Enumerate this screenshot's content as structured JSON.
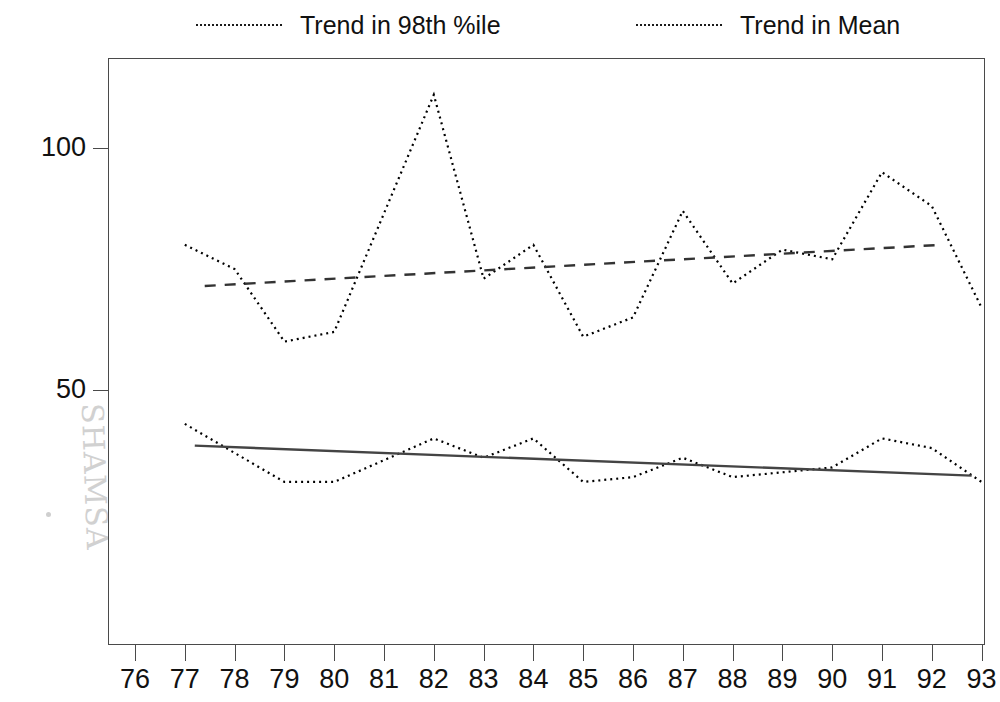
{
  "chart_data": {
    "type": "line",
    "title": "",
    "subtitle": "",
    "xlabel": "",
    "ylabel": "",
    "x": [
      76,
      77,
      78,
      79,
      80,
      81,
      82,
      83,
      84,
      85,
      86,
      87,
      88,
      89,
      90,
      91,
      92,
      93
    ],
    "categories": [
      "76",
      "77",
      "78",
      "79",
      "80",
      "81",
      "82",
      "83",
      "84",
      "85",
      "86",
      "87",
      "88",
      "89",
      "90",
      "91",
      "92",
      "93"
    ],
    "xlim": [
      75.5,
      93.5
    ],
    "ylim": [
      10,
      122
    ],
    "yticks": [
      50,
      100
    ],
    "ytick_labels": [
      "50",
      "100"
    ],
    "grid": false,
    "legend_position": "top",
    "series": [
      {
        "name": "Trend in 98th %ile",
        "marker": "plus",
        "linestyle": "dotted",
        "color": "#000000",
        "x": [
          77,
          78,
          79,
          80,
          82,
          83,
          84,
          85,
          86,
          87,
          88,
          89,
          90,
          91,
          92,
          93
        ],
        "values": [
          80,
          75,
          60,
          62,
          111,
          73,
          80,
          61,
          65,
          87,
          72,
          79,
          77,
          95,
          88,
          67
        ]
      },
      {
        "name": "Trend in Mean",
        "marker": "diamond",
        "linestyle": "dotted",
        "color": "#000000",
        "x": [
          77,
          78,
          79,
          80,
          82,
          83,
          84,
          85,
          86,
          87,
          88,
          89,
          90,
          91,
          92,
          93
        ],
        "values": [
          43,
          37,
          31,
          31,
          40,
          36,
          40,
          31,
          32,
          36,
          32,
          33,
          34,
          40,
          38,
          31
        ]
      }
    ],
    "trendlines": [
      {
        "name": "98th %ile trend fit",
        "linestyle": "dashed",
        "color": "#333333",
        "x": [
          77.4,
          92.2
        ],
        "values": [
          71.5,
          80.0
        ]
      },
      {
        "name": "Mean trend fit",
        "linestyle": "solid",
        "color": "#444444",
        "x": [
          77.2,
          92.8
        ],
        "values": [
          38.5,
          32.3
        ]
      }
    ]
  },
  "legend": {
    "entries": [
      {
        "label": "Trend in 98th %ile",
        "marker": "plus-marker"
      },
      {
        "label": "Trend in Mean",
        "marker": "diamond-marker"
      }
    ]
  },
  "watermark": {
    "text": "SHAMSA"
  }
}
